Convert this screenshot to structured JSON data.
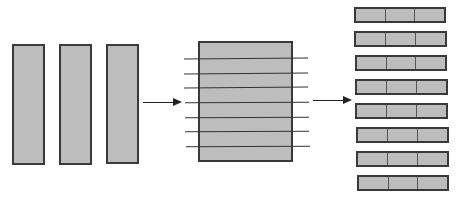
{
  "diagram": {
    "colors": {
      "fill": "#bdbdbd",
      "stroke": "#3a3a3a",
      "background": "#ffffff"
    },
    "stage1": {
      "name": "input-blocks",
      "count": 3
    },
    "stage2": {
      "name": "striped-block",
      "stripe_lines": 7
    },
    "stage3": {
      "name": "row-blocks",
      "rows": 8,
      "cells_per_row": 3
    },
    "arrows": 2
  }
}
